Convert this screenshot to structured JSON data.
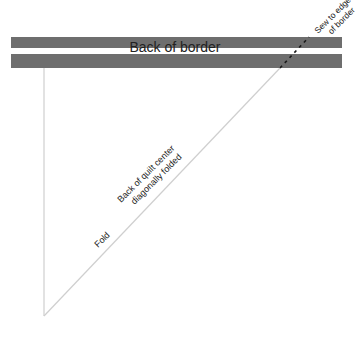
{
  "diagram": {
    "title_label": "Back of border",
    "sew_label_line1": "Sew to edge",
    "sew_label_line2": "of border",
    "quilt_label_line1": "Back of quilt center",
    "quilt_label_line2": "diagonally folded",
    "fold_label": "Fold",
    "colors": {
      "border_band": "#6e6e6e",
      "border_stripe": "#ffffff",
      "outline": "#cfcfcf",
      "seam": "#1a1a1a",
      "text": "#222222"
    }
  }
}
